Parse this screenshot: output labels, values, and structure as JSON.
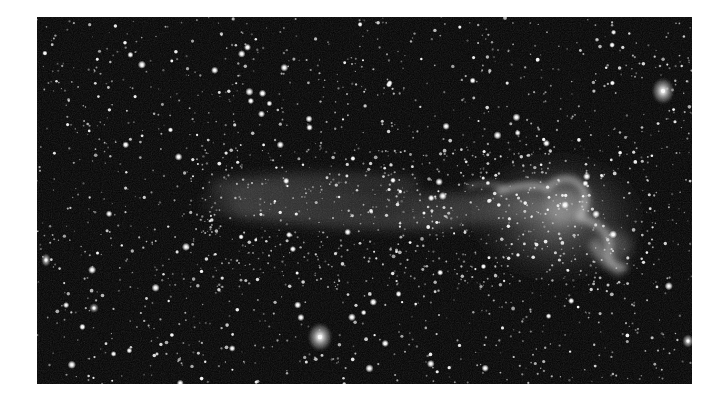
{
  "image": {
    "kind": "astronomical-photograph",
    "colormode": "grayscale",
    "subject": "galaxy-with-tail",
    "frame": {
      "x": 37,
      "y": 17,
      "width": 655,
      "height": 367
    },
    "colors": {
      "page_background": "#ffffff",
      "sky": "#020202",
      "star": "#ffffff",
      "nebula": "#bdbdbd"
    },
    "starfield": {
      "seed": 7,
      "faint_count": 1500,
      "medium_count": 420,
      "bright_count": 70
    },
    "bright_objects": [
      {
        "name": "fuzzy-galaxy-top-right",
        "x": 626,
        "y": 74,
        "rx": 12,
        "ry": 14
      },
      {
        "name": "fuzzy-galaxy-bottom",
        "x": 283,
        "y": 320,
        "rx": 13,
        "ry": 15
      },
      {
        "name": "bright-star-left-edge",
        "x": 9,
        "y": 243,
        "rx": 5,
        "ry": 7
      },
      {
        "name": "bright-star-right-edge",
        "x": 651,
        "y": 324,
        "rx": 6,
        "ry": 7
      },
      {
        "name": "small-fuzzy-left",
        "x": 57,
        "y": 291,
        "rx": 5,
        "ry": 5
      }
    ],
    "nebula_head": {
      "x": 527,
      "y": 190,
      "core_x": 528,
      "core_y": 188
    },
    "tail": {
      "start_x": 160,
      "end_x": 500,
      "center_y": 185
    }
  }
}
